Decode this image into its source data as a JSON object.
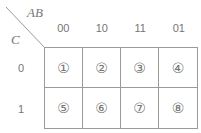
{
  "map": {
    "top_axis_label": "AB",
    "side_axis_label": "C",
    "column_headers": [
      "00",
      "10",
      "11",
      "01"
    ],
    "row_headers": [
      "0",
      "1"
    ],
    "cells": [
      [
        "①",
        "②",
        "③",
        "④"
      ],
      [
        "⑤",
        "⑥",
        "⑦",
        "⑧"
      ]
    ],
    "colors": {
      "line": "#9a9a9a",
      "text": "#757575",
      "background": "#ffffff"
    }
  }
}
